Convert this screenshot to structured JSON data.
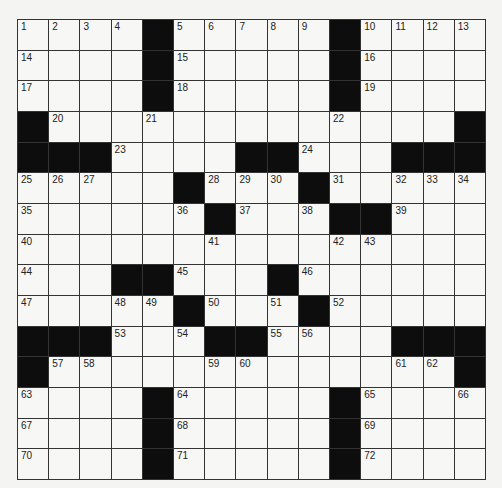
{
  "puzzle": {
    "rows": 15,
    "cols": 15,
    "colors": {
      "black": "#0d0d0d",
      "white": "#f7f7f5",
      "line": "#333333"
    },
    "grid": [
      [
        1,
        2,
        3,
        4,
        "#",
        5,
        6,
        7,
        8,
        9,
        "#",
        10,
        11,
        12,
        13
      ],
      [
        14,
        0,
        0,
        0,
        "#",
        15,
        0,
        0,
        0,
        0,
        "#",
        16,
        0,
        0,
        0
      ],
      [
        17,
        0,
        0,
        0,
        "#",
        18,
        0,
        0,
        0,
        0,
        "#",
        19,
        0,
        0,
        0
      ],
      [
        "#",
        20,
        0,
        0,
        21,
        0,
        0,
        0,
        0,
        0,
        22,
        0,
        0,
        0,
        "#"
      ],
      [
        "#",
        "#",
        "#",
        23,
        0,
        0,
        0,
        "#",
        "#",
        24,
        0,
        0,
        "#",
        "#",
        "#"
      ],
      [
        25,
        26,
        27,
        0,
        0,
        "#",
        28,
        29,
        30,
        "#",
        31,
        0,
        32,
        33,
        34
      ],
      [
        35,
        0,
        0,
        0,
        0,
        36,
        "#",
        37,
        0,
        38,
        "#",
        "#",
        39,
        0,
        0
      ],
      [
        40,
        0,
        0,
        0,
        0,
        0,
        41,
        0,
        0,
        0,
        42,
        43,
        0,
        0,
        0
      ],
      [
        44,
        0,
        0,
        "#",
        "#",
        45,
        0,
        0,
        "#",
        46,
        0,
        0,
        0,
        0,
        0
      ],
      [
        47,
        0,
        0,
        48,
        49,
        "#",
        50,
        0,
        51,
        "#",
        52,
        0,
        0,
        0,
        0
      ],
      [
        "#",
        "#",
        "#",
        53,
        0,
        54,
        "#",
        "#",
        55,
        56,
        0,
        0,
        "#",
        "#",
        "#"
      ],
      [
        "#",
        57,
        58,
        0,
        0,
        0,
        59,
        60,
        0,
        0,
        0,
        0,
        61,
        62,
        "#"
      ],
      [
        63,
        0,
        0,
        0,
        "#",
        64,
        0,
        0,
        0,
        0,
        "#",
        65,
        0,
        0,
        66
      ],
      [
        67,
        0,
        0,
        0,
        "#",
        68,
        0,
        0,
        0,
        0,
        "#",
        69,
        0,
        0,
        0
      ],
      [
        70,
        0,
        0,
        0,
        "#",
        71,
        0,
        0,
        0,
        0,
        "#",
        72,
        0,
        0,
        0
      ]
    ]
  }
}
